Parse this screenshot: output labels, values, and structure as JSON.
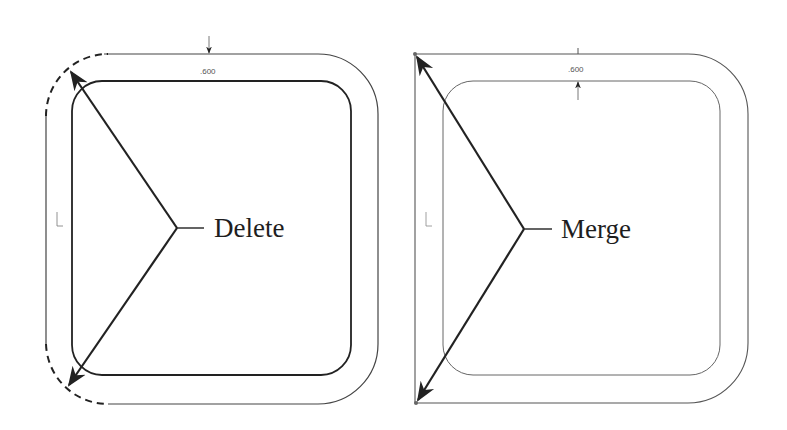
{
  "diagram": {
    "left_panel": {
      "label": "Delete",
      "dimension": ".600",
      "corner_style": "dashed-rounded (deleted corners)"
    },
    "right_panel": {
      "label": "Merge",
      "dimension": ".600",
      "corner_style": "sharp merged corners"
    },
    "colors": {
      "line": "#2a2a2a",
      "thin_line": "#555555",
      "background": "#ffffff"
    }
  }
}
